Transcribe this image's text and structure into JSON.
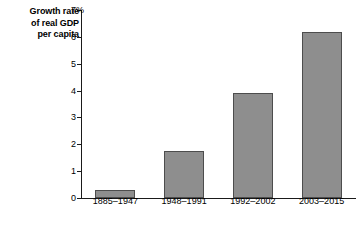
{
  "chart_data": {
    "type": "bar",
    "title": "Growth rate of real GDP per capita",
    "title_lines": [
      "Growth rate",
      "of real GDP",
      "per capita"
    ],
    "xlabel": "",
    "ylabel": "Growth rate of real GDP per capita",
    "categories": [
      "1885–1947",
      "1948–1991",
      "1992–2002",
      "2003–2015"
    ],
    "values": [
      0.3,
      1.75,
      3.9,
      6.2
    ],
    "series": [
      {
        "name": "Growth rate of real GDP per capita",
        "values": [
          0.3,
          1.75,
          3.9,
          6.2
        ]
      }
    ],
    "ylim": [
      0,
      7
    ],
    "ytick_values": [
      0,
      1,
      2,
      3,
      4,
      5,
      6,
      7
    ],
    "ytick_labels": [
      "0",
      "1",
      "2",
      "3",
      "4",
      "5",
      "6",
      "7%"
    ],
    "grid": false,
    "legend": false,
    "legend_position": "none",
    "bar_color": "#8e8e8e",
    "bar_border_color": "#4d4d4d",
    "axis_color": "#1a1a1a",
    "background_color": "#ffffff",
    "units": "percent"
  }
}
